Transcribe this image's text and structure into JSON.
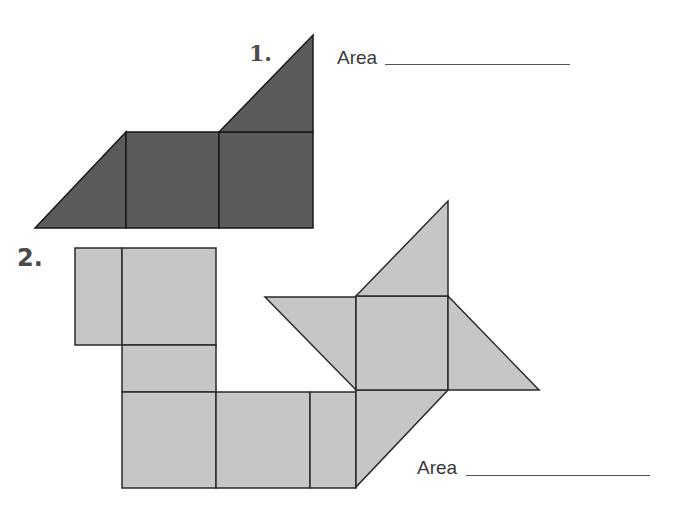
{
  "problems": [
    {
      "number": "1.",
      "area_label": "Area",
      "fill": "#5b5b5b",
      "shapes": [
        {
          "type": "triangle",
          "points": "35,228 126,132 126,228"
        },
        {
          "type": "square",
          "points": "126,132 219,132 219,228 126,228"
        },
        {
          "type": "square",
          "points": "219,132 313,132 313,228 219,228"
        },
        {
          "type": "triangle",
          "points": "219,132 313,35 313,132"
        }
      ]
    },
    {
      "number": "2.",
      "area_label": "Area",
      "fill": "#c6c6c6",
      "shapes": [
        {
          "type": "rectangle",
          "points": "75,248 122,248 122,345 75,345"
        },
        {
          "type": "square",
          "points": "122,248 216,248 216,345 122,345"
        },
        {
          "type": "rectangle",
          "points": "122,345 216,345 216,392 122,392"
        },
        {
          "type": "square",
          "points": "122,392 216,392 216,488 122,488"
        },
        {
          "type": "square",
          "points": "216,392 310,392 310,488 216,488"
        },
        {
          "type": "rectangle",
          "points": "310,392 356,392 356,488 310,488"
        },
        {
          "type": "triangle",
          "points": "356,390 448,390 356,487"
        },
        {
          "type": "triangle",
          "points": "265,297 356,297 356,390"
        },
        {
          "type": "square",
          "points": "356,296 448,296 448,390 356,390"
        },
        {
          "type": "triangle",
          "points": "356,296 448,201 448,296"
        },
        {
          "type": "triangle",
          "points": "448,296 539,390 448,390"
        }
      ]
    }
  ]
}
